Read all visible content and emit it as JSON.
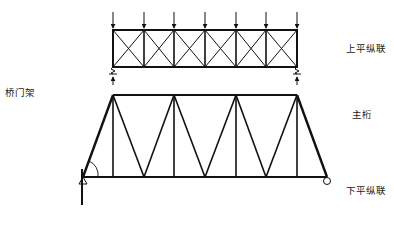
{
  "diagram": {
    "labels": {
      "upper_bracing": "上平纵联",
      "main_truss": "主桁",
      "lower_bracing": "下平纵联",
      "portal_frame": "桥门架"
    },
    "nodes": {
      "B1": "B",
      "B1_sub": "1",
      "A1": "A",
      "A1_sub": "1",
      "E0": "E",
      "E0_sub": "o",
      "F0": "F",
      "F0_sub": "o",
      "theta": "θ"
    },
    "loads": {
      "upper": "W",
      "lower": "w",
      "upper_reaction": "R",
      "lower_reaction": "r"
    },
    "upper_bracing": {
      "panels": 6,
      "load_count": 7,
      "load_label": "W",
      "reactions": [
        "R",
        "R"
      ]
    },
    "main_truss": {
      "panels": 8,
      "supports": [
        "pin",
        "roller"
      ]
    },
    "lower_bracing": {
      "panels": 8,
      "load_count": 9,
      "load_label": "w",
      "reactions": [
        "r",
        "r"
      ]
    },
    "colors": {
      "line": "#111111",
      "background": "#ffffff"
    }
  }
}
